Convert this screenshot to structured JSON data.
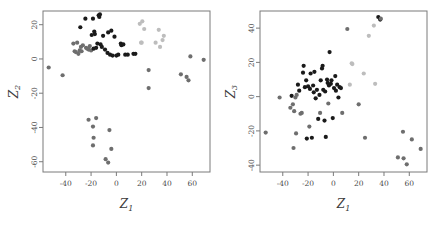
{
  "figure": {
    "type": "scatter-matrix-pair",
    "background": "#ffffff",
    "panel_count": 2
  },
  "chart_data": [
    {
      "type": "scatter",
      "title": "",
      "xlabel": "Z1",
      "ylabel": "Z2",
      "xlabel_display": "Z",
      "xlabel_sub": "1",
      "ylabel_display": "Z",
      "ylabel_sub": "2",
      "xlim": [
        -58,
        74
      ],
      "ylim": [
        -66,
        28
      ],
      "xticks": [
        -40,
        -20,
        0,
        20,
        40,
        60
      ],
      "xticklabels": [
        "-40",
        "-20",
        "0",
        "20",
        "40",
        "60"
      ],
      "yticks": [
        20,
        0,
        -20,
        -40,
        -60
      ],
      "yticklabels": [
        "20",
        "0",
        "-20",
        "-40",
        "-60"
      ],
      "grid": false,
      "legend": "none",
      "marker": "filled-circle",
      "marker_size": 2.1,
      "colors": {
        "dark": "#1a1a1a",
        "mid": "#6e6e6e",
        "light": "#bdbdbd"
      },
      "points": [
        {
          "x": -53.5,
          "y": -5.0,
          "c": "mid"
        },
        {
          "x": -42.5,
          "y": -9.5,
          "c": "mid"
        },
        {
          "x": -34.0,
          "y": 9.0,
          "c": "mid"
        },
        {
          "x": -33.0,
          "y": 4.5,
          "c": "mid"
        },
        {
          "x": -32.0,
          "y": 4.0,
          "c": "mid"
        },
        {
          "x": -31.0,
          "y": 9.5,
          "c": "mid"
        },
        {
          "x": -30.0,
          "y": 3.0,
          "c": "mid"
        },
        {
          "x": -29.0,
          "y": 5.0,
          "c": "mid"
        },
        {
          "x": -28.5,
          "y": 18.5,
          "c": "dark"
        },
        {
          "x": -28.0,
          "y": 7.0,
          "c": "mid"
        },
        {
          "x": -27.5,
          "y": 4.5,
          "c": "mid"
        },
        {
          "x": -26.5,
          "y": 8.0,
          "c": "mid"
        },
        {
          "x": -24.5,
          "y": 23.5,
          "c": "dark"
        },
        {
          "x": -24.0,
          "y": 6.5,
          "c": "mid"
        },
        {
          "x": -23.0,
          "y": 6.0,
          "c": "mid"
        },
        {
          "x": -22.0,
          "y": 5.5,
          "c": "mid"
        },
        {
          "x": -21.0,
          "y": 7.5,
          "c": "mid"
        },
        {
          "x": -20.0,
          "y": 5.0,
          "c": "mid"
        },
        {
          "x": -19.5,
          "y": 14.0,
          "c": "dark"
        },
        {
          "x": -18.5,
          "y": 23.5,
          "c": "dark"
        },
        {
          "x": -18.0,
          "y": 6.0,
          "c": "dark"
        },
        {
          "x": -17.5,
          "y": 16.0,
          "c": "dark"
        },
        {
          "x": -17.0,
          "y": 14.5,
          "c": "dark"
        },
        {
          "x": -16.0,
          "y": 6.5,
          "c": "dark"
        },
        {
          "x": -15.0,
          "y": 9.0,
          "c": "dark"
        },
        {
          "x": -14.0,
          "y": 25.5,
          "c": "dark"
        },
        {
          "x": -13.5,
          "y": 24.5,
          "c": "dark"
        },
        {
          "x": -13.0,
          "y": 26.0,
          "c": "dark"
        },
        {
          "x": -12.5,
          "y": 8.5,
          "c": "dark"
        },
        {
          "x": -11.5,
          "y": 7.0,
          "c": "dark"
        },
        {
          "x": -10.5,
          "y": 13.5,
          "c": "dark"
        },
        {
          "x": -9.0,
          "y": 5.5,
          "c": "dark"
        },
        {
          "x": -7.0,
          "y": 3.5,
          "c": "dark"
        },
        {
          "x": -6.5,
          "y": 15.5,
          "c": "dark"
        },
        {
          "x": -5.0,
          "y": 2.5,
          "c": "dark"
        },
        {
          "x": -4.0,
          "y": 16.5,
          "c": "dark"
        },
        {
          "x": -3.0,
          "y": 2.0,
          "c": "dark"
        },
        {
          "x": -1.5,
          "y": 13.0,
          "c": "dark"
        },
        {
          "x": 0.0,
          "y": 2.0,
          "c": "dark"
        },
        {
          "x": 1.5,
          "y": 2.5,
          "c": "dark"
        },
        {
          "x": 3.5,
          "y": 9.0,
          "c": "dark"
        },
        {
          "x": 4.0,
          "y": 8.0,
          "c": "dark"
        },
        {
          "x": 5.5,
          "y": 8.5,
          "c": "dark"
        },
        {
          "x": 7.0,
          "y": 2.5,
          "c": "dark"
        },
        {
          "x": 9.0,
          "y": 2.5,
          "c": "dark"
        },
        {
          "x": 13.5,
          "y": 3.0,
          "c": "dark"
        },
        {
          "x": 15.0,
          "y": 3.0,
          "c": "dark"
        },
        {
          "x": 18.5,
          "y": 20.5,
          "c": "light"
        },
        {
          "x": 19.5,
          "y": 9.5,
          "c": "light"
        },
        {
          "x": 20.0,
          "y": 9.5,
          "c": "light"
        },
        {
          "x": 20.5,
          "y": 22.0,
          "c": "light"
        },
        {
          "x": 22.0,
          "y": 17.5,
          "c": "light"
        },
        {
          "x": 25.5,
          "y": -6.5,
          "c": "mid"
        },
        {
          "x": 25.5,
          "y": -17.0,
          "c": "mid"
        },
        {
          "x": 31.0,
          "y": 9.5,
          "c": "light"
        },
        {
          "x": 33.5,
          "y": 17.0,
          "c": "light"
        },
        {
          "x": 34.5,
          "y": 7.0,
          "c": "light"
        },
        {
          "x": 36.5,
          "y": 11.0,
          "c": "light"
        },
        {
          "x": 37.5,
          "y": 13.5,
          "c": "light"
        },
        {
          "x": 51.0,
          "y": -9.0,
          "c": "mid"
        },
        {
          "x": 55.5,
          "y": -10.5,
          "c": "mid"
        },
        {
          "x": 57.0,
          "y": -12.5,
          "c": "mid"
        },
        {
          "x": 58.5,
          "y": 1.5,
          "c": "mid"
        },
        {
          "x": 69.0,
          "y": -0.5,
          "c": "mid"
        },
        {
          "x": -22.0,
          "y": -35.5,
          "c": "mid"
        },
        {
          "x": -18.5,
          "y": -39.5,
          "c": "mid"
        },
        {
          "x": -16.0,
          "y": -34.5,
          "c": "mid"
        },
        {
          "x": -18.0,
          "y": -46.0,
          "c": "mid"
        },
        {
          "x": -18.5,
          "y": -50.5,
          "c": "mid"
        },
        {
          "x": -5.5,
          "y": -41.5,
          "c": "mid"
        },
        {
          "x": -4.0,
          "y": -52.5,
          "c": "mid"
        },
        {
          "x": -8.5,
          "y": -58.5,
          "c": "mid"
        },
        {
          "x": -6.5,
          "y": -60.5,
          "c": "mid"
        }
      ]
    },
    {
      "type": "scatter",
      "title": "",
      "xlabel": "Z1",
      "ylabel": "Z3",
      "xlabel_display": "Z",
      "xlabel_sub": "1",
      "ylabel_display": "Z",
      "ylabel_sub": "3",
      "xlim": [
        -58,
        74
      ],
      "ylim": [
        -44,
        50
      ],
      "xticks": [
        -40,
        -20,
        0,
        20,
        40,
        60
      ],
      "xticklabels": [
        "-40",
        "-20",
        "0",
        "20",
        "40",
        "60"
      ],
      "yticks": [
        40,
        20,
        0,
        -20,
        -40
      ],
      "yticklabels": [
        "40",
        "20",
        "0",
        "-20",
        "-40"
      ],
      "grid": false,
      "legend": "none",
      "marker": "filled-circle",
      "marker_size": 2.1,
      "colors": {
        "dark": "#1a1a1a",
        "mid": "#6e6e6e",
        "light": "#bdbdbd"
      },
      "points": [
        {
          "x": -53.5,
          "y": -21.0,
          "c": "mid"
        },
        {
          "x": -42.5,
          "y": -0.5,
          "c": "mid"
        },
        {
          "x": -34.0,
          "y": -6.5,
          "c": "mid"
        },
        {
          "x": -33.0,
          "y": 0.5,
          "c": "dark"
        },
        {
          "x": -32.0,
          "y": -4.5,
          "c": "mid"
        },
        {
          "x": -31.5,
          "y": -30.0,
          "c": "mid"
        },
        {
          "x": -31.0,
          "y": -8.5,
          "c": "mid"
        },
        {
          "x": -30.0,
          "y": -0.5,
          "c": "mid"
        },
        {
          "x": -29.5,
          "y": -21.5,
          "c": "mid"
        },
        {
          "x": -29.0,
          "y": 1.0,
          "c": "mid"
        },
        {
          "x": -28.0,
          "y": 7.0,
          "c": "dark"
        },
        {
          "x": -27.0,
          "y": 3.5,
          "c": "dark"
        },
        {
          "x": -26.0,
          "y": -10.0,
          "c": "mid"
        },
        {
          "x": -25.0,
          "y": -9.5,
          "c": "mid"
        },
        {
          "x": -24.0,
          "y": 14.0,
          "c": "dark"
        },
        {
          "x": -23.5,
          "y": 18.0,
          "c": "dark"
        },
        {
          "x": -22.5,
          "y": 5.5,
          "c": "dark"
        },
        {
          "x": -21.5,
          "y": 9.5,
          "c": "dark"
        },
        {
          "x": -21.0,
          "y": -24.5,
          "c": "dark"
        },
        {
          "x": -20.0,
          "y": 6.0,
          "c": "dark"
        },
        {
          "x": -19.0,
          "y": -17.5,
          "c": "mid"
        },
        {
          "x": -18.5,
          "y": 4.5,
          "c": "dark"
        },
        {
          "x": -18.0,
          "y": 13.5,
          "c": "dark"
        },
        {
          "x": -17.0,
          "y": -24.0,
          "c": "dark"
        },
        {
          "x": -16.0,
          "y": 6.5,
          "c": "dark"
        },
        {
          "x": -15.5,
          "y": 2.5,
          "c": "dark"
        },
        {
          "x": -15.0,
          "y": 14.5,
          "c": "dark"
        },
        {
          "x": -14.0,
          "y": -1.0,
          "c": "dark"
        },
        {
          "x": -13.0,
          "y": 4.0,
          "c": "dark"
        },
        {
          "x": -12.0,
          "y": -13.0,
          "c": "dark"
        },
        {
          "x": -11.0,
          "y": 1.0,
          "c": "dark"
        },
        {
          "x": -10.5,
          "y": -9.5,
          "c": "mid"
        },
        {
          "x": -10.0,
          "y": 9.5,
          "c": "dark"
        },
        {
          "x": -9.0,
          "y": 16.5,
          "c": "dark"
        },
        {
          "x": -8.5,
          "y": 18.0,
          "c": "dark"
        },
        {
          "x": -8.0,
          "y": 4.0,
          "c": "dark"
        },
        {
          "x": -7.0,
          "y": -14.0,
          "c": "dark"
        },
        {
          "x": -6.5,
          "y": 3.0,
          "c": "dark"
        },
        {
          "x": -6.0,
          "y": -23.5,
          "c": "dark"
        },
        {
          "x": -5.0,
          "y": 10.0,
          "c": "dark"
        },
        {
          "x": -4.5,
          "y": 8.0,
          "c": "dark"
        },
        {
          "x": -4.0,
          "y": -4.0,
          "c": "mid"
        },
        {
          "x": -3.5,
          "y": 6.5,
          "c": "dark"
        },
        {
          "x": -3.0,
          "y": 26.0,
          "c": "dark"
        },
        {
          "x": -2.0,
          "y": 7.5,
          "c": "dark"
        },
        {
          "x": -1.5,
          "y": 9.5,
          "c": "dark"
        },
        {
          "x": -0.5,
          "y": -12.5,
          "c": "dark"
        },
        {
          "x": 0.5,
          "y": 5.0,
          "c": "dark"
        },
        {
          "x": 1.5,
          "y": 12.0,
          "c": "dark"
        },
        {
          "x": 2.0,
          "y": 3.5,
          "c": "dark"
        },
        {
          "x": 3.0,
          "y": 7.0,
          "c": "dark"
        },
        {
          "x": 4.0,
          "y": -0.5,
          "c": "dark"
        },
        {
          "x": 5.0,
          "y": 5.5,
          "c": "dark"
        },
        {
          "x": 6.0,
          "y": 5.0,
          "c": "dark"
        },
        {
          "x": 7.0,
          "y": -9.5,
          "c": "mid"
        },
        {
          "x": 11.0,
          "y": 39.5,
          "c": "mid"
        },
        {
          "x": 13.0,
          "y": 7.0,
          "c": "light"
        },
        {
          "x": 14.5,
          "y": 19.5,
          "c": "light"
        },
        {
          "x": 15.0,
          "y": 19.0,
          "c": "light"
        },
        {
          "x": 20.0,
          "y": -4.5,
          "c": "mid"
        },
        {
          "x": 24.0,
          "y": 13.5,
          "c": "light"
        },
        {
          "x": 25.0,
          "y": -24.0,
          "c": "mid"
        },
        {
          "x": 28.0,
          "y": 35.5,
          "c": "light"
        },
        {
          "x": 32.0,
          "y": 41.5,
          "c": "light"
        },
        {
          "x": 33.0,
          "y": 7.5,
          "c": "light"
        },
        {
          "x": 35.5,
          "y": 46.5,
          "c": "dark"
        },
        {
          "x": 37.0,
          "y": 45.0,
          "c": "dark"
        },
        {
          "x": 37.5,
          "y": 45.5,
          "c": "mid"
        },
        {
          "x": 51.0,
          "y": -35.5,
          "c": "mid"
        },
        {
          "x": 55.0,
          "y": -20.5,
          "c": "mid"
        },
        {
          "x": 55.5,
          "y": -36.0,
          "c": "mid"
        },
        {
          "x": 58.0,
          "y": -39.5,
          "c": "mid"
        },
        {
          "x": 62.0,
          "y": -25.0,
          "c": "mid"
        },
        {
          "x": 69.0,
          "y": -30.5,
          "c": "mid"
        }
      ]
    }
  ]
}
